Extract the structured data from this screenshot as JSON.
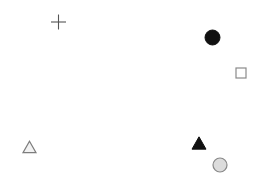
{
  "figure": {
    "width": 258,
    "height": 184,
    "background_color": "#ffffff",
    "title": "",
    "axes_visible": false,
    "grid_visible": false,
    "legend_visible": false
  },
  "chart_data": {
    "type": "scatter",
    "title": "",
    "xlabel": "",
    "ylabel": "",
    "xlim": [
      0,
      258
    ],
    "ylim": [
      0,
      184
    ],
    "grid": false,
    "legend": "none",
    "axis_visible": false,
    "note": "Pixel coordinates; y measured downward from top-left of the 258x184 canvas.",
    "points": [
      {
        "id": "marker-plus",
        "marker": "plus",
        "x": 58.5,
        "y": 22.0,
        "size": 15,
        "fill": "none",
        "stroke": "#555555",
        "stroke_width": 1.1
      },
      {
        "id": "marker-circle-filled",
        "marker": "circle-filled",
        "x": 212.5,
        "y": 37.5,
        "size": 15,
        "fill": "#111111",
        "stroke": "#111111",
        "stroke_width": 1
      },
      {
        "id": "marker-square-open",
        "marker": "square-open",
        "x": 241.0,
        "y": 73.0,
        "size": 10,
        "fill": "#ffffff",
        "stroke": "#8a8a8a",
        "stroke_width": 1.2
      },
      {
        "id": "marker-triangle-open",
        "marker": "triangle-open",
        "x": 29.5,
        "y": 147.0,
        "size": 13,
        "fill": "#f2f2f2",
        "stroke": "#7d7d7d",
        "stroke_width": 1.2
      },
      {
        "id": "marker-triangle-filled",
        "marker": "triangle-filled",
        "x": 199.0,
        "y": 143.0,
        "size": 14,
        "fill": "#111111",
        "stroke": "#111111",
        "stroke_width": 1
      },
      {
        "id": "marker-circle-gray",
        "marker": "circle-filled-outlined",
        "x": 220.0,
        "y": 165.0,
        "size": 14,
        "fill": "#dcdcdc",
        "stroke": "#888888",
        "stroke_width": 1.2
      }
    ]
  }
}
